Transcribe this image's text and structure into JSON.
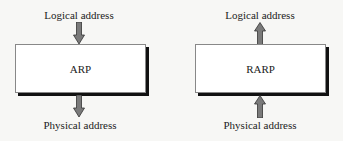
{
  "diagram": {
    "left": {
      "box_label": "ARP",
      "input_label": "Logical address",
      "output_label": "Physical address",
      "direction": "logical-to-physical"
    },
    "right": {
      "box_label": "RARP",
      "input_label": "Physical address",
      "output_label": "Logical address",
      "direction": "physical-to-logical"
    }
  },
  "colors": {
    "arrow_fill": "#7a7a7a",
    "arrow_outline": "#333333",
    "box_fill": "#ffffff",
    "box_shadow": "#111111",
    "background": "#f7f7f5"
  }
}
